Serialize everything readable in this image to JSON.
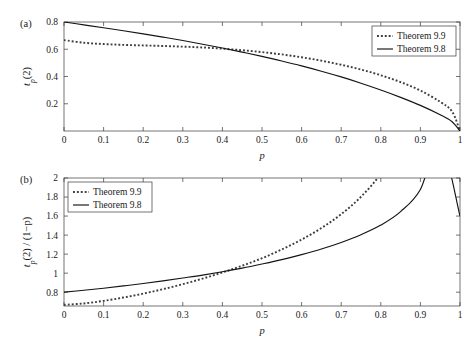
{
  "figure": {
    "background": "#ffffff",
    "axis_color": "#3a3a3a",
    "solid_color": "#141414",
    "dotted_color": "#3d3d3d"
  },
  "panels": [
    {
      "tag": "(a)",
      "xlabel": "p",
      "ylabel_parts": {
        "base": "t",
        "sub": "p",
        "rest": "(2)"
      },
      "legend_position": "top-right",
      "legend": [
        {
          "label": "Theorem 9.9",
          "style": "dotted"
        },
        {
          "label": "Theorem 9.8",
          "style": "solid"
        }
      ],
      "xticks": [
        "0",
        "0.1",
        "0.2",
        "0.3",
        "0.4",
        "0.5",
        "0.6",
        "0.7",
        "0.8",
        "0.9",
        "1"
      ],
      "yticks": [
        "0.2",
        "0.4",
        "0.6",
        "0.8"
      ]
    },
    {
      "tag": "(b)",
      "xlabel": "p",
      "ylabel_parts": {
        "base": "t",
        "sub": "p",
        "rest": "(2) / (1−p)"
      },
      "legend_position": "top-left",
      "legend": [
        {
          "label": "Theorem 9.9",
          "style": "dotted"
        },
        {
          "label": "Theorem 9.8",
          "style": "solid"
        }
      ],
      "xticks": [
        "0",
        "0.1",
        "0.2",
        "0.3",
        "0.4",
        "0.5",
        "0.6",
        "0.7",
        "0.8",
        "0.9",
        "1"
      ],
      "yticks": [
        "0.8",
        "1",
        "1.2",
        "1.4",
        "1.6",
        "1.8",
        "2"
      ]
    }
  ],
  "chart_data": [
    {
      "type": "line",
      "panel": "(a)",
      "title": "",
      "xlabel": "p",
      "ylabel": "t_p(2)",
      "xlim": [
        0,
        1
      ],
      "ylim": [
        0,
        0.8
      ],
      "xticks": [
        0,
        0.1,
        0.2,
        0.3,
        0.4,
        0.5,
        0.6,
        0.7,
        0.8,
        0.9,
        1
      ],
      "yticks": [
        0.2,
        0.4,
        0.6,
        0.8
      ],
      "grid": false,
      "legend": [
        "Theorem 9.9",
        "Theorem 9.8"
      ],
      "legend_position": "top-right",
      "x": [
        0,
        0.05,
        0.1,
        0.15,
        0.2,
        0.25,
        0.3,
        0.35,
        0.4,
        0.45,
        0.5,
        0.55,
        0.6,
        0.65,
        0.7,
        0.75,
        0.8,
        0.85,
        0.9,
        0.95,
        0.98,
        1
      ],
      "series": [
        {
          "name": "Theorem 9.9",
          "style": "dotted",
          "values": [
            0.667,
            0.648,
            0.638,
            0.632,
            0.628,
            0.624,
            0.619,
            0.613,
            0.604,
            0.593,
            0.579,
            0.562,
            0.541,
            0.516,
            0.486,
            0.451,
            0.409,
            0.359,
            0.297,
            0.214,
            0.143,
            0.0
          ]
        },
        {
          "name": "Theorem 9.8",
          "style": "solid",
          "values": [
            0.8,
            0.779,
            0.758,
            0.736,
            0.713,
            0.689,
            0.664,
            0.637,
            0.609,
            0.579,
            0.548,
            0.514,
            0.478,
            0.439,
            0.397,
            0.351,
            0.301,
            0.247,
            0.188,
            0.119,
            0.068,
            0.0
          ]
        }
      ]
    },
    {
      "type": "line",
      "panel": "(b)",
      "title": "",
      "xlabel": "p",
      "ylabel": "t_p(2) / (1-p)",
      "xlim": [
        0,
        1
      ],
      "ylim": [
        0.655,
        2.0
      ],
      "xticks": [
        0,
        0.1,
        0.2,
        0.3,
        0.4,
        0.5,
        0.6,
        0.7,
        0.8,
        0.9,
        1
      ],
      "yticks": [
        0.8,
        1,
        1.2,
        1.4,
        1.6,
        1.8,
        2
      ],
      "grid": false,
      "legend": [
        "Theorem 9.9",
        "Theorem 9.8"
      ],
      "legend_position": "top-left",
      "x": [
        0,
        0.05,
        0.1,
        0.15,
        0.2,
        0.25,
        0.3,
        0.35,
        0.4,
        0.45,
        0.5,
        0.55,
        0.6,
        0.65,
        0.7,
        0.75,
        0.8,
        0.85,
        0.9,
        0.95,
        1
      ],
      "series": [
        {
          "name": "Theorem 9.9",
          "style": "dotted",
          "values": [
            0.667,
            0.682,
            0.709,
            0.744,
            0.785,
            0.832,
            0.884,
            0.943,
            1.007,
            1.078,
            1.157,
            1.249,
            1.353,
            1.474,
            1.62,
            1.803,
            2.045,
            2.393,
            2.97,
            4.28,
            1.97
          ]
        },
        {
          "name": "Theorem 9.8",
          "style": "solid",
          "values": [
            0.8,
            0.82,
            0.842,
            0.866,
            0.891,
            0.919,
            0.949,
            0.98,
            1.015,
            1.053,
            1.096,
            1.142,
            1.195,
            1.254,
            1.323,
            1.404,
            1.505,
            1.647,
            1.88,
            2.38,
            1.6
          ]
        }
      ]
    }
  ]
}
